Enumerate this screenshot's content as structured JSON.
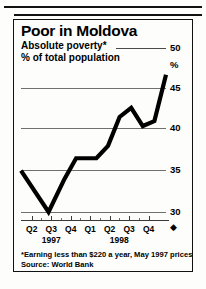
{
  "figure": {
    "title": "Poor in Moldova",
    "subtitle": "Absolute poverty*",
    "unit_line": "% of total population",
    "footnote": "*Earning less than $220 a year, May 1997 prices",
    "source": "Source: World Bank",
    "percent_symbol": "%",
    "axis_arrow": "◆"
  },
  "chart_data": {
    "type": "line",
    "title": "Poor in Moldova",
    "subtitle": "Absolute poverty*",
    "xlabel": "",
    "ylabel": "% of total population",
    "ylim": [
      28,
      50
    ],
    "yticks": [
      30,
      35,
      40,
      45,
      50
    ],
    "ytick_labels": [
      "30",
      "35",
      "40",
      "45",
      "50"
    ],
    "grid": true,
    "legend": null,
    "categories": [
      "Q2",
      "Q3",
      "Q4",
      "Q1",
      "Q2",
      "Q3",
      "Q4"
    ],
    "year_groups": [
      {
        "label": "1997",
        "quarters": [
          "Q2",
          "Q3",
          "Q4"
        ]
      },
      {
        "label": "1998",
        "quarters": [
          "Q1",
          "Q2",
          "Q3",
          "Q4"
        ]
      }
    ],
    "series": [
      {
        "name": "Absolute poverty",
        "color": "#000000",
        "values": [
          35.0,
          30.0,
          36.5,
          36.5,
          40.0,
          42.5,
          40.5,
          46.5
        ],
        "x": [
          "Q2 1997",
          "Q3 1997",
          "Q4 1997",
          "Q1 1998",
          "Q2 1998",
          "Q3 1998",
          "Q4 1998",
          "Q4 1998 end"
        ]
      }
    ],
    "vertices_pct": [
      {
        "x": 0,
        "y": 35.0
      },
      {
        "x": 19,
        "y": 30.0
      },
      {
        "x": 30,
        "y": 34.0
      },
      {
        "x": 38,
        "y": 36.5
      },
      {
        "x": 52,
        "y": 36.5
      },
      {
        "x": 60,
        "y": 38.0
      },
      {
        "x": 68,
        "y": 41.5
      },
      {
        "x": 76,
        "y": 42.6
      },
      {
        "x": 84,
        "y": 40.4
      },
      {
        "x": 92,
        "y": 41.0
      },
      {
        "x": 100,
        "y": 46.6
      }
    ]
  }
}
